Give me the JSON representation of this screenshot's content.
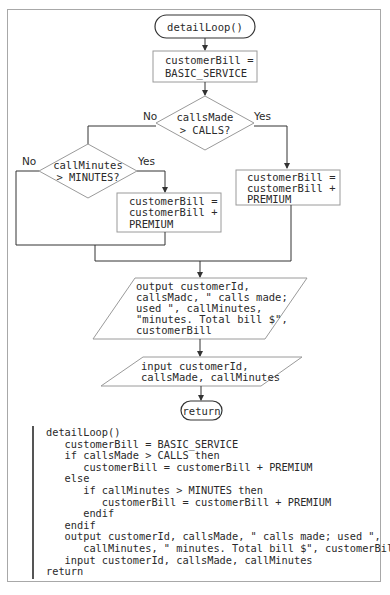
{
  "flowchart": {
    "start": "detailLoop()",
    "init_box": [
      "customerBill =",
      "BASIC_SERVICE"
    ],
    "decision1": {
      "lines": [
        "callsMade",
        "> CALLS?"
      ],
      "no_label": "No",
      "yes_label": "Yes"
    },
    "decision2": {
      "lines": [
        "callMinutes",
        "> MINUTES?"
      ],
      "no_label": "No",
      "yes_label": "Yes"
    },
    "yes1_box": [
      "customerBill =",
      "customerBill +",
      "PREMIUM"
    ],
    "yes2_box": [
      "customerBill =",
      "customerBill +",
      "PREMIUM"
    ],
    "output_box": [
      "output customerId,",
      "callsMadc, \" calls made;",
      "used \", callMinutes,",
      "\"minutes. Total bill $\",",
      "customerBill"
    ],
    "input_box": [
      "input customerId,",
      "callsMade, callMinutes"
    ],
    "end": "return"
  },
  "pseudocode": [
    "detailLoop()",
    "   customerBill = BASIC_SERVICE",
    "   if callsMade > CALLS then",
    "      customerBill = customerBill + PREMIUM",
    "   else",
    "      if callMinutes > MINUTES then",
    "         customerBill = customerBill + PREMIUM",
    "      endif",
    "   endif",
    "   output customerId, callsMade, \" calls made; used \",",
    "      callMinutes, \" minutes. Total bill $\", customerBill",
    "   input customerId, callsMade, callMinutes",
    "return"
  ],
  "colors": {
    "line": "#333333",
    "box_border": "#9a9a9a",
    "frame": "#a8a8a8",
    "text": "#2a2a2a"
  }
}
